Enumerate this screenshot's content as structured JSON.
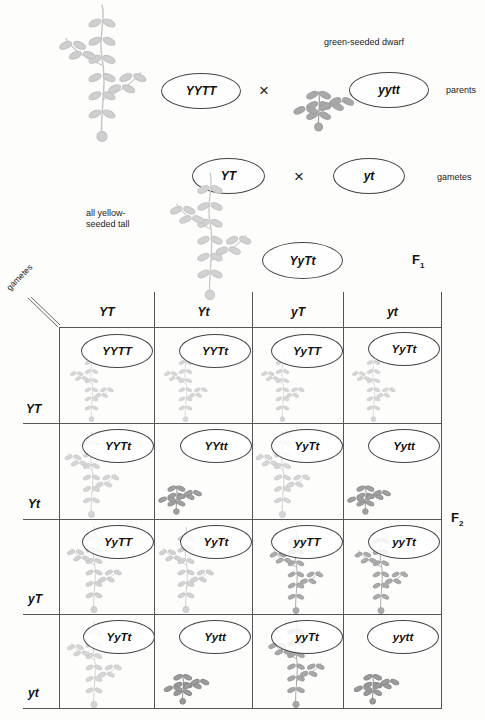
{
  "parents": {
    "label": "parents",
    "cross_symbol": "×",
    "left": {
      "genotype": "YYTT",
      "plant": "tall"
    },
    "right": {
      "genotype": "yytt",
      "plant": "dwarf",
      "description": "green-seeded dwarf"
    }
  },
  "gametes_row": {
    "label": "gametes",
    "cross_symbol": "×",
    "left": "YT",
    "right": "yt"
  },
  "f1": {
    "label": "F",
    "sub": "1",
    "genotype": "YyTt",
    "description_line1": "all yellow-",
    "description_line2": "seeded tall"
  },
  "punnett": {
    "corner_label": "gametes",
    "generation_label": "F",
    "generation_sub": "2",
    "columns": [
      "YT",
      "Yt",
      "yT",
      "yt"
    ],
    "rows": [
      "YT",
      "Yt",
      "yT",
      "yt"
    ],
    "cells": [
      [
        {
          "genotype": "YYTT",
          "phenotype": "yellow tall"
        },
        {
          "genotype": "YYTt",
          "phenotype": "yellow tall"
        },
        {
          "genotype": "YyTT",
          "phenotype": "yellow tall"
        },
        {
          "genotype": "YyTt",
          "phenotype": "yellow tall"
        }
      ],
      [
        {
          "genotype": "YYTt",
          "phenotype": "yellow tall"
        },
        {
          "genotype": "YYtt",
          "phenotype": "yellow dwarf"
        },
        {
          "genotype": "YyTt",
          "phenotype": "yellow tall"
        },
        {
          "genotype": "Yytt",
          "phenotype": "yellow dwarf"
        }
      ],
      [
        {
          "genotype": "YyTT",
          "phenotype": "yellow tall"
        },
        {
          "genotype": "YyTt",
          "phenotype": "yellow tall"
        },
        {
          "genotype": "yyTT",
          "phenotype": "green tall"
        },
        {
          "genotype": "yyTt",
          "phenotype": "green tall"
        }
      ],
      [
        {
          "genotype": "YyTt",
          "phenotype": "yellow tall"
        },
        {
          "genotype": "Yytt",
          "phenotype": "yellow dwarf"
        },
        {
          "genotype": "yyTt",
          "phenotype": "green tall"
        },
        {
          "genotype": "yytt",
          "phenotype": "green dwarf"
        }
      ]
    ]
  },
  "colors": {
    "yellow_plant": "#c9c9c9",
    "green_plant": "#9a9a9a",
    "line": "#555555"
  }
}
